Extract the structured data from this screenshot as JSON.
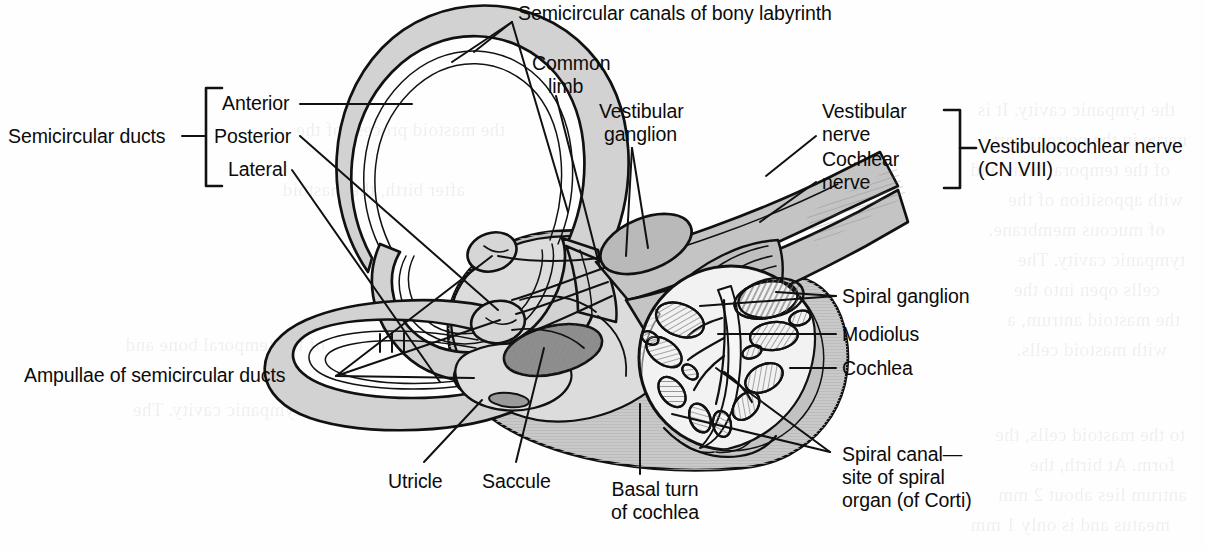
{
  "figure": {
    "kind": "anatomical-illustration",
    "palette": {
      "ink": "#111111",
      "paper": "#fefefe",
      "duct_fill": "#d2d2d2",
      "bony_fill": "#c9c9c9",
      "vestibule_fill": "#d6d6d6",
      "cochlea_fill": "#c2c2c2",
      "cochlea_lumen": "#f2f2f2",
      "saccule_fill": "#8e8e8e",
      "nerve_fill": "#bdbdbd",
      "hatch": "#8a8a8a"
    }
  },
  "labels": {
    "semicircular_canals": "Semicircular canals of bony labyrinth",
    "common_limb_line1": "Common",
    "common_limb_line2": "limb",
    "vestibular_ganglion_line1": "Vestibular",
    "vestibular_ganglion_line2": "ganglion",
    "vestibular_nerve_line1": "Vestibular",
    "vestibular_nerve_line2": "nerve",
    "cochlear_nerve_line1": "Cochlear",
    "cochlear_nerve_line2": "nerve",
    "vestibulocochlear_line1": "Vestibulocochlear nerve",
    "vestibulocochlear_line2": "(CN VIII)",
    "semicircular_ducts": "Semicircular ducts",
    "anterior": "Anterior",
    "posterior": "Posterior",
    "lateral": "Lateral",
    "ampullae": "Ampullae of semicircular ducts",
    "utricle": "Utricle",
    "saccule": "Saccule",
    "basal_turn_line1": "Basal turn",
    "basal_turn_line2": "of cochlea",
    "spiral_ganglion": "Spiral ganglion",
    "modiolus": "Modiolus",
    "cochlea": "Cochlea",
    "spiral_canal_line1": "Spiral canal—",
    "spiral_canal_line2": "site of spiral",
    "spiral_canal_line3": "organ (of Corti)"
  },
  "bracket_groups": [
    {
      "name": "semicircular-ducts",
      "side": "left",
      "members": [
        "Anterior",
        "Posterior",
        "Lateral"
      ],
      "title": "Semicircular ducts"
    },
    {
      "name": "vestibulocochlear-nerve",
      "side": "right",
      "members": [
        "Vestibular nerve",
        "Cochlear nerve"
      ],
      "title": "Vestibulocochlear nerve (CN VIII)"
    }
  ],
  "callouts": [
    "Semicircular canals of bony labyrinth",
    "Common limb",
    "Vestibular ganglion",
    "Vestibular nerve",
    "Cochlear nerve",
    "Ampullae of semicircular ducts",
    "Utricle",
    "Saccule",
    "Basal turn of cochlea",
    "Spiral ganglion",
    "Modiolus",
    "Cochlea",
    "Spiral canal—site of spiral organ (of Corti)"
  ],
  "bleed_text": [
    "the tympanic cavity. It is",
    "nerve in the petrous part",
    "of the temporal bone and",
    "with apposition of the",
    "of mucous membrane.",
    "tympanic cavity. The",
    "cells open into the",
    "the mastoid antrum, a",
    "with mastoid cells.",
    "to the mastoid cells, the",
    "form. At birth, the",
    "antrum lies about 2 mm",
    "meatus and is only 1 mm",
    "the mastoid process of the",
    "after birth, the mastoid"
  ]
}
